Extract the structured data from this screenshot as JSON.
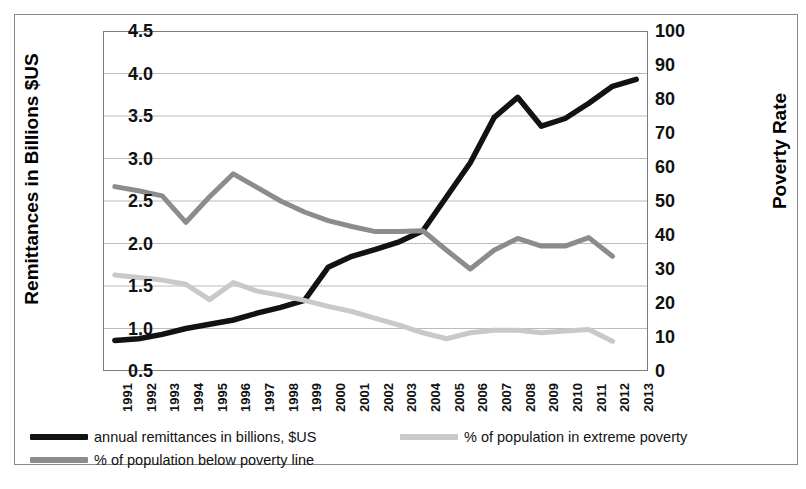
{
  "chart_data": {
    "type": "line",
    "title": "",
    "xlabel": "",
    "ylabel": "Remittances in Billions $US",
    "y2label": "Poverty Rate",
    "grid": true,
    "legend_position": "bottom",
    "x": [
      1991,
      1992,
      1993,
      1994,
      1995,
      1996,
      1997,
      1998,
      1999,
      2000,
      2001,
      2002,
      2003,
      2004,
      2005,
      2006,
      2007,
      2008,
      2009,
      2010,
      2011,
      2012,
      2013
    ],
    "categories": [
      "1991",
      "1992",
      "1993",
      "1994",
      "1995",
      "1996",
      "1997",
      "1998",
      "1999",
      "2000",
      "2001",
      "2002",
      "2003",
      "2004",
      "2005",
      "2006",
      "2007",
      "2008",
      "2009",
      "2010",
      "2011",
      "2012",
      "2013"
    ],
    "ylim": [
      0.5,
      4.5
    ],
    "yticks": [
      "0.5",
      "1.0",
      "1.5",
      "2.0",
      "2.5",
      "3.0",
      "3.5",
      "4.0",
      "4.5"
    ],
    "y2lim": [
      0,
      100
    ],
    "y2ticks": [
      "0",
      "10",
      "20",
      "30",
      "40",
      "50",
      "60",
      "70",
      "80",
      "90",
      "100"
    ],
    "series": [
      {
        "name": "annual remittances in billions, $US",
        "color": "#121212",
        "axis": "left",
        "values": [
          0.86,
          0.88,
          0.93,
          1.0,
          1.05,
          1.1,
          1.18,
          1.25,
          1.33,
          1.72,
          1.85,
          1.93,
          2.02,
          2.15,
          2.55,
          2.95,
          3.48,
          3.72,
          3.38,
          3.47,
          3.65,
          3.85,
          3.93
        ]
      },
      {
        "name": "% of population below poverty line",
        "color": "#8c8c8c",
        "axis": "left",
        "values": [
          2.67,
          2.62,
          2.56,
          2.25,
          2.55,
          2.82,
          2.66,
          2.5,
          2.37,
          2.27,
          2.2,
          2.14,
          2.14,
          2.15,
          1.92,
          1.7,
          1.92,
          2.06,
          1.97,
          1.97,
          2.07,
          1.85,
          null
        ]
      },
      {
        "name": "% of population in extreme poverty",
        "color": "#c9c9c9",
        "axis": "left",
        "values": [
          1.63,
          1.6,
          1.57,
          1.52,
          1.34,
          1.54,
          1.44,
          1.39,
          1.33,
          1.26,
          1.2,
          1.12,
          1.04,
          0.95,
          0.88,
          0.95,
          0.98,
          0.98,
          0.95,
          0.97,
          0.99,
          0.85,
          null
        ]
      }
    ]
  },
  "legend": {
    "items": [
      {
        "label": "annual remittances in billions, $US",
        "color": "#121212"
      },
      {
        "label": "% of population in extreme poverty",
        "color": "#c9c9c9"
      },
      {
        "label": "% of population below poverty line",
        "color": "#8c8c8c"
      }
    ]
  }
}
